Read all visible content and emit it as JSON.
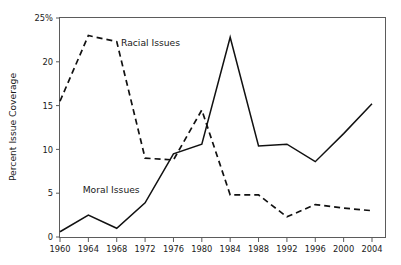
{
  "chart_data": {
    "type": "line",
    "title": "",
    "subtitle": "",
    "xlabel": "",
    "ylabel": "Percent Issue Coverage",
    "x": [
      1960,
      1964,
      1968,
      1972,
      1976,
      1980,
      1984,
      1988,
      1992,
      1996,
      2000,
      2004
    ],
    "xtick_labels": [
      "1960",
      "1964",
      "1968",
      "1972",
      "1976",
      "1980",
      "1984",
      "1988",
      "1992",
      "1996",
      "2000",
      "2004"
    ],
    "ytick_labels": [
      "0",
      "5",
      "10",
      "15",
      "20",
      "25%"
    ],
    "ytick_values": [
      0,
      5,
      10,
      15,
      20,
      25
    ],
    "xlim": [
      1960,
      2004
    ],
    "ylim": [
      0,
      25
    ],
    "grid": false,
    "legend_position": "inline-annotations",
    "series": [
      {
        "name": "Racial Issues",
        "style": "dashed",
        "color": "#111111",
        "values": [
          15.5,
          23.0,
          22.3,
          9.0,
          8.8,
          14.5,
          4.8,
          4.8,
          2.3,
          3.7,
          3.3,
          3.0
        ]
      },
      {
        "name": "Moral Issues",
        "style": "solid",
        "color": "#111111",
        "values": [
          0.6,
          2.5,
          1.0,
          3.9,
          9.5,
          10.6,
          22.8,
          10.4,
          10.6,
          8.6,
          11.8,
          15.2
        ]
      }
    ],
    "annotations": [
      {
        "text": "Racial Issues",
        "x": 1968.6,
        "y": 21.8
      },
      {
        "text": "Moral Issues",
        "x": 1963.2,
        "y": 5.0
      }
    ]
  }
}
